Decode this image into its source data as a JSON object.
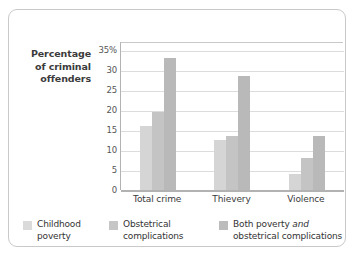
{
  "figure": {
    "frame_border_color": "#c9c9c9",
    "background_color": "#ffffff"
  },
  "axis_title": "Percentage of criminal offenders",
  "legend": {
    "items": [
      {
        "label": "Childhood poverty",
        "swatch_name": "legend-swatch-childhood-poverty",
        "color": "#dadada"
      },
      {
        "label": "Obstetrical complications",
        "swatch_name": "legend-swatch-obstetrical-complications",
        "color": "#c6c6c6"
      },
      {
        "label_pre": "Both poverty ",
        "label_em": "and",
        "label_post": " obstetrical complications",
        "swatch_name": "legend-swatch-both",
        "color": "#bcbcbc"
      }
    ]
  },
  "chart_data": {
    "type": "bar",
    "title": "",
    "xlabel": "",
    "ylabel": "Percentage of criminal offenders",
    "categories": [
      "Total crime",
      "Thievery",
      "Violence"
    ],
    "series": [
      {
        "name": "Childhood poverty",
        "color": "#d5d5d5",
        "values": [
          16,
          12.5,
          4
        ]
      },
      {
        "name": "Obstetrical complications",
        "color": "#c4c4c4",
        "values": [
          19.5,
          13.5,
          8
        ]
      },
      {
        "name": "Both poverty and obstetrical complications",
        "color": "#b9b9b9",
        "values": [
          33,
          28.5,
          13.5
        ]
      }
    ],
    "ylim": [
      0,
      37
    ],
    "yticks": [
      0,
      5,
      10,
      15,
      20,
      25,
      30,
      35
    ],
    "ytick_labels": [
      "0",
      "5",
      "10",
      "15",
      "20",
      "25",
      "30",
      "35%"
    ],
    "grid": "horizontal",
    "legend_position": "bottom"
  }
}
